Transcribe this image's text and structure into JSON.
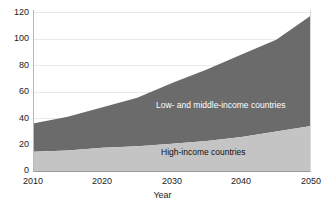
{
  "chart_data": {
    "type": "area",
    "title": "",
    "subtitle": "",
    "xlabel": "Year",
    "ylabel": "",
    "stacked": true,
    "grid": true,
    "legend_position": "in-plot-annotation",
    "xlim": [
      2010,
      2050
    ],
    "ylim": [
      0,
      120
    ],
    "x": [
      2010,
      2015,
      2020,
      2025,
      2030,
      2035,
      2040,
      2045,
      2050
    ],
    "xticks": [
      "2010",
      "2020",
      "2030",
      "2040",
      "2050"
    ],
    "yticks": [
      "0",
      "20",
      "40",
      "60",
      "80",
      "100",
      "120"
    ],
    "series": [
      {
        "name": "High-income countries",
        "color": "#c4c4c4",
        "label_color": "#101010",
        "values": [
          15,
          16,
          18,
          19,
          21,
          23,
          26,
          30,
          34
        ]
      },
      {
        "name": "Low- and middle-income countries",
        "color": "#6b6b6b",
        "label_color": "#ffffff",
        "values": [
          21,
          25,
          30,
          36,
          45,
          53,
          61,
          68,
          82
        ]
      }
    ],
    "cumulative_totals": [
      36,
      41,
      48,
      55,
      66,
      76,
      87,
      98,
      116
    ],
    "annotations": [
      {
        "text": "Low- and middle-income countries",
        "series": "Low- and middle-income countries"
      },
      {
        "text": "High-income countries",
        "series": "High-income countries"
      }
    ]
  },
  "axes": {
    "y_ticks": [
      {
        "label": "120",
        "value": 120
      },
      {
        "label": "100",
        "value": 100
      },
      {
        "label": "80",
        "value": 80
      },
      {
        "label": "60",
        "value": 60
      },
      {
        "label": "40",
        "value": 40
      },
      {
        "label": "20",
        "value": 20
      },
      {
        "label": "0",
        "value": 0
      }
    ],
    "x_ticks": [
      {
        "label": "2010",
        "value": 2010
      },
      {
        "label": "2020",
        "value": 2020
      },
      {
        "label": "2030",
        "value": 2030
      },
      {
        "label": "2040",
        "value": 2040
      },
      {
        "label": "2050",
        "value": 2050
      }
    ],
    "x_axis_title": "Year"
  },
  "colors": {
    "upper_band": "#6b6b6b",
    "lower_band": "#c4c4c4",
    "gridline": "#eaeaea",
    "axis": "#9a9a9a",
    "background": "#ffffff"
  }
}
